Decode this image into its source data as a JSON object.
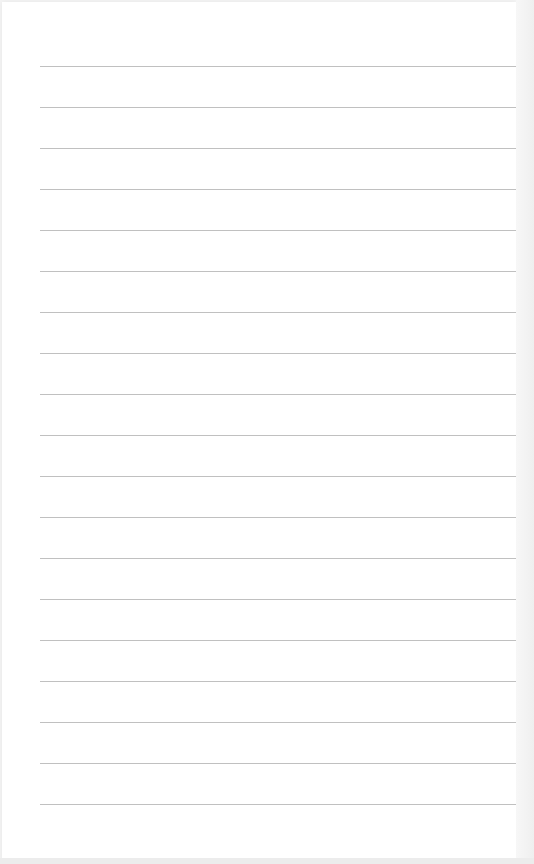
{
  "document": {
    "type": "lined-paper",
    "rule_count": 19,
    "rule_color": "#b5b5b5",
    "paper_color": "#ffffff",
    "text": []
  }
}
